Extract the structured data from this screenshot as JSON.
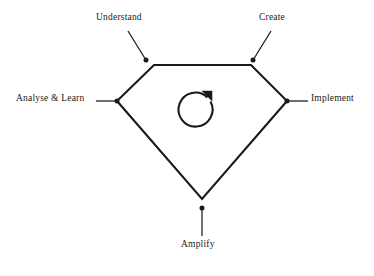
{
  "diagram": {
    "type": "cycle-pentagon",
    "background_color": "#ffffff",
    "stroke_color": "#1a1a1a",
    "center_icon": "refresh-clockwise-icon",
    "nodes": [
      {
        "id": "understand",
        "label": "Understand",
        "position": "top-left",
        "dot": {
          "x": 146,
          "y": 60
        },
        "leader": {
          "x1": 128,
          "y1": 31,
          "x2": 145,
          "y2": 59
        }
      },
      {
        "id": "create",
        "label": "Create",
        "position": "top-right",
        "dot": {
          "x": 253,
          "y": 60
        },
        "leader": {
          "x1": 271,
          "y1": 31,
          "x2": 254,
          "y2": 59
        }
      },
      {
        "id": "implement",
        "label": "Implement",
        "position": "right",
        "dot": {
          "x": 287,
          "y": 101
        },
        "leader": {
          "x1": 288,
          "y1": 101,
          "x2": 308,
          "y2": 101
        }
      },
      {
        "id": "amplify",
        "label": "Amplify",
        "position": "bottom",
        "dot": {
          "x": 202,
          "y": 208
        },
        "leader": {
          "x1": 202,
          "y1": 209,
          "x2": 202,
          "y2": 236
        }
      },
      {
        "id": "analyse-learn",
        "label": "Analyse & Learn",
        "position": "left",
        "dot": {
          "x": 117,
          "y": 101
        },
        "leader": {
          "x1": 96,
          "y1": 101,
          "x2": 116,
          "y2": 101
        }
      }
    ],
    "shape_vertices": [
      {
        "x": 154,
        "y": 65
      },
      {
        "x": 251,
        "y": 65
      },
      {
        "x": 287,
        "y": 101
      },
      {
        "x": 202,
        "y": 199
      },
      {
        "x": 117,
        "y": 101
      }
    ]
  }
}
